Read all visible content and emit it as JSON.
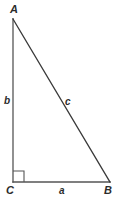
{
  "figure": {
    "name": "right-triangle",
    "background_color": "#ffffff",
    "stroke_color": "#555555",
    "text_color": "#2b2b2b",
    "canvas": {
      "width": 119,
      "height": 206
    }
  },
  "vertices": [
    {
      "id": "A",
      "label": "A",
      "x": 13,
      "y": 19
    },
    {
      "id": "C",
      "label": "C",
      "x": 13,
      "y": 182
    },
    {
      "id": "B",
      "label": "B",
      "x": 110,
      "y": 182
    }
  ],
  "sides": [
    {
      "id": "a",
      "label": "a",
      "from": "C",
      "to": "B",
      "role": "leg"
    },
    {
      "id": "b",
      "label": "b",
      "from": "A",
      "to": "C",
      "role": "leg"
    },
    {
      "id": "c",
      "label": "c",
      "from": "A",
      "to": "B",
      "role": "hypotenuse"
    }
  ],
  "right_angle": {
    "at": "C",
    "marker": "square",
    "size": 10
  },
  "geometry": {
    "leg_b_path": "M 13 19 L 13 182",
    "leg_a_path": "M 13 182 L 110 182",
    "hypotenuse_path": "M 13 19 L 110 182",
    "right_angle_path": "M 13 171 L 24 171 L 24 182",
    "stroke_width": 1.3
  }
}
